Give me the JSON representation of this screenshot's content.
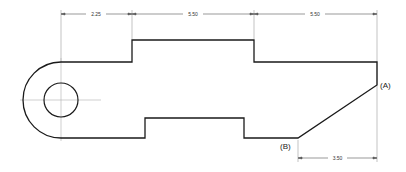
{
  "diagram": {
    "type": "engineering-drawing",
    "colors": {
      "outline": "#1a1a1a",
      "dimension": "#555555",
      "centerline": "#aaaaaa",
      "extension": "#999999",
      "background": "#ffffff"
    },
    "dimensions": {
      "top": [
        {
          "label": "2.25",
          "from": "left-center",
          "to": "step-1"
        },
        {
          "label": "5.50",
          "from": "step-1",
          "to": "step-2"
        },
        {
          "label": "5.50",
          "from": "step-2",
          "to": "right-edge"
        }
      ],
      "bottom": [
        {
          "label": "3.50",
          "from": "point-B",
          "to": "point-A"
        }
      ]
    },
    "points": {
      "A": {
        "label": "(A)"
      },
      "B": {
        "label": "(B)"
      }
    },
    "features": {
      "hole": "circular-hole",
      "end": "semicircular-end"
    }
  }
}
